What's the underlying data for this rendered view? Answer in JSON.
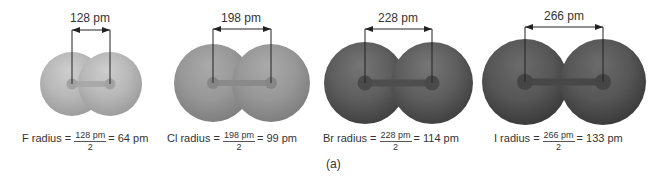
{
  "figure": {
    "panel_label": "(a)",
    "line_color": "#222222",
    "text_color": "#333333",
    "molecules": [
      {
        "element": "F",
        "bond_length_label": "128 pm",
        "formula": {
          "lhs": "F radius =",
          "numerator": "128 pm",
          "denominator": "2",
          "rhs": "= 64 pm"
        },
        "colors": {
          "highlight": "#cecece",
          "base": "#b7b7b7",
          "edge": "#9d9d9d",
          "bond": "#a9a9a9",
          "nucleus": "#a2a2a2"
        }
      },
      {
        "element": "Cl",
        "bond_length_label": "198 pm",
        "formula": {
          "lhs": "Cl radius =",
          "numerator": "198 pm",
          "denominator": "2",
          "rhs": "= 99 pm"
        },
        "colors": {
          "highlight": "#aaaaaa",
          "base": "#979797",
          "edge": "#7f7f7f",
          "bond": "#8a8a8a",
          "nucleus": "#868686"
        }
      },
      {
        "element": "Br",
        "bond_length_label": "228 pm",
        "formula": {
          "lhs": "Br radius =",
          "numerator": "228 pm",
          "denominator": "2",
          "rhs": "= 114 pm"
        },
        "colors": {
          "highlight": "#767676",
          "base": "#5d5d5d",
          "edge": "#414141",
          "bond": "#4e4e4e",
          "nucleus": "#4a4a4a"
        }
      },
      {
        "element": "I",
        "bond_length_label": "266 pm",
        "formula": {
          "lhs": "I radius =",
          "numerator": "266 pm",
          "denominator": "2",
          "rhs": "= 133 pm"
        },
        "colors": {
          "highlight": "#6b6b6b",
          "base": "#565656",
          "edge": "#3b3b3b",
          "bond": "#474747",
          "nucleus": "#454545"
        }
      }
    ]
  }
}
